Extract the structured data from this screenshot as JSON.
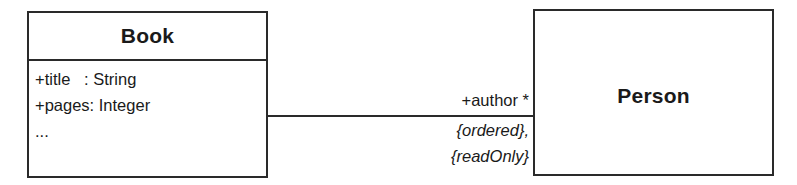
{
  "diagram": {
    "type": "UML class diagram",
    "classes": [
      {
        "id": "book",
        "name": "Book",
        "attributes": [
          "+title   : String",
          "+pages: Integer",
          "..."
        ]
      },
      {
        "id": "person",
        "name": "Person",
        "attributes": []
      }
    ],
    "association": {
      "from": "Book",
      "to": "Person",
      "role": "+author",
      "multiplicity": "*",
      "role_label": "+author *",
      "constraints": [
        "{ordered},",
        "{readOnly}"
      ]
    }
  }
}
